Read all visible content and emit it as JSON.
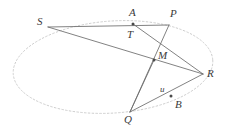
{
  "figure": {
    "type": "geometry-diagram",
    "canvas": {
      "width": 226,
      "height": 133,
      "background": "#ffffff"
    },
    "colors": {
      "ellipse_stroke": "#c9c9c9",
      "chord_stroke": "#6b6b6b",
      "point_fill": "#4a4a4a",
      "label_color": "#3a3a3a"
    },
    "ellipse": {
      "name": "conic-ellipse",
      "cx": 113,
      "cy": 67,
      "rx": 100,
      "ry": 46,
      "rotation": -4,
      "stroke": "#c9c9c9",
      "stroke_width": 0.9,
      "dashed": true
    },
    "points": [
      {
        "id": "S",
        "label": "S",
        "x": 48,
        "y": 27,
        "label_x": 37,
        "label_y": 16,
        "on_ellipse": true,
        "marked": false
      },
      {
        "id": "A",
        "label": "A",
        "x": 133,
        "y": 24,
        "label_x": 129,
        "label_y": 7,
        "on_ellipse": false,
        "marked": true
      },
      {
        "id": "T",
        "label": "T",
        "x": 133,
        "y": 24,
        "label_x": 127,
        "label_y": 29,
        "on_ellipse": false,
        "marked": false
      },
      {
        "id": "P",
        "label": "P",
        "x": 169,
        "y": 25,
        "label_x": 170,
        "label_y": 8,
        "on_ellipse": true,
        "marked": false
      },
      {
        "id": "M",
        "label": "M",
        "x": 154,
        "y": 60,
        "label_x": 158,
        "label_y": 50,
        "on_ellipse": false,
        "marked": true
      },
      {
        "id": "R",
        "label": "R",
        "x": 203,
        "y": 74,
        "label_x": 207,
        "label_y": 68,
        "on_ellipse": true,
        "marked": false
      },
      {
        "id": "u",
        "label": "u",
        "x": 171,
        "y": 96,
        "label_x": 160,
        "label_y": 85,
        "on_ellipse": false,
        "marked": true
      },
      {
        "id": "B",
        "label": "B",
        "x": 171,
        "y": 96,
        "label_x": 175,
        "label_y": 99,
        "on_ellipse": false,
        "marked": false
      },
      {
        "id": "Q",
        "label": "Q",
        "x": 130,
        "y": 112,
        "label_x": 124,
        "label_y": 114,
        "on_ellipse": true,
        "marked": false
      }
    ],
    "segments": [
      {
        "id": "S-P",
        "from": "S",
        "to": "P",
        "name": "chord-s-p"
      },
      {
        "id": "S-R",
        "from": "S",
        "to": "R",
        "name": "chord-s-r"
      },
      {
        "id": "P-Q",
        "from": "P",
        "to": "Q",
        "name": "chord-p-q"
      },
      {
        "id": "T-R",
        "from": "T",
        "to": "R",
        "name": "segment-t-r"
      },
      {
        "id": "Q-R",
        "from": "Q",
        "to": "R",
        "name": "chord-q-r"
      },
      {
        "id": "M-Q",
        "from": "M",
        "to": "Q",
        "name": "segment-m-q"
      }
    ]
  }
}
